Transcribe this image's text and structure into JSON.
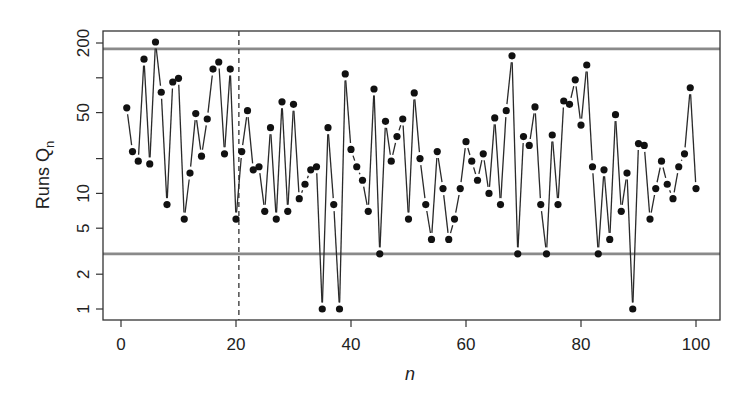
{
  "chart_data": {
    "type": "line",
    "style": "points-and-lines (R type='b')",
    "title": "",
    "xlabel": "n",
    "ylabel": "Runs Q",
    "ylabel_subscript": "n",
    "xlim": [
      -3,
      104
    ],
    "ylim": [
      0.84,
      240
    ],
    "yscale": "log",
    "xticks": [
      0,
      20,
      40,
      60,
      80,
      100
    ],
    "xtick_labels": [
      "0",
      "20",
      "40",
      "60",
      "80",
      "100"
    ],
    "yticks": [
      1,
      2,
      5,
      10,
      20,
      50,
      100,
      200
    ],
    "ytick_labels": [
      "1",
      "2",
      "5",
      "10",
      "",
      "50",
      "",
      "200"
    ],
    "grid": false,
    "legend": null,
    "reference_lines": {
      "horizontal": [
        {
          "name": "upper-limit",
          "y": 178,
          "color": "#8a8a8a"
        },
        {
          "name": "lower-limit",
          "y": 3,
          "color": "#8a8a8a"
        }
      ],
      "vertical": [
        {
          "name": "change-point",
          "x": 20.5,
          "style": "dashed",
          "color": "#333333"
        }
      ]
    },
    "x": [
      1,
      2,
      3,
      4,
      5,
      6,
      7,
      8,
      9,
      10,
      11,
      12,
      13,
      14,
      15,
      16,
      17,
      18,
      19,
      20,
      21,
      22,
      23,
      24,
      25,
      26,
      27,
      28,
      29,
      30,
      31,
      32,
      33,
      34,
      35,
      36,
      37,
      38,
      39,
      40,
      41,
      42,
      43,
      44,
      45,
      46,
      47,
      48,
      49,
      50,
      51,
      52,
      53,
      54,
      55,
      56,
      57,
      58,
      59,
      60,
      61,
      62,
      63,
      64,
      65,
      66,
      67,
      68,
      69,
      70,
      71,
      72,
      73,
      74,
      75,
      76,
      77,
      78,
      79,
      80,
      81,
      82,
      83,
      84,
      85,
      86,
      87,
      88,
      89,
      90,
      91,
      92,
      93,
      94,
      95,
      96,
      97,
      98,
      99,
      100
    ],
    "series": [
      {
        "name": "Runs Q_n",
        "color": "#111111",
        "values": [
          55,
          23,
          19,
          145,
          18,
          204,
          75,
          8,
          92,
          99,
          6,
          15,
          49,
          21,
          44,
          119,
          137,
          22,
          119,
          6,
          23,
          52,
          16,
          17,
          7,
          37,
          6,
          62,
          7,
          59,
          9,
          12,
          16,
          17,
          1,
          37,
          8,
          1,
          108,
          24,
          17,
          13,
          7,
          80,
          3,
          42,
          19,
          31,
          44,
          6,
          74,
          20,
          8,
          4,
          23,
          11,
          4,
          6,
          11,
          28,
          19,
          13,
          22,
          10,
          45,
          8,
          52,
          155,
          3,
          31,
          26,
          56,
          8,
          3,
          32,
          8,
          63,
          59,
          96,
          39,
          129,
          17,
          3,
          16,
          4,
          48,
          7,
          15,
          1,
          27,
          26,
          6,
          11,
          19,
          12,
          9,
          17,
          22,
          82,
          11
        ]
      }
    ]
  }
}
